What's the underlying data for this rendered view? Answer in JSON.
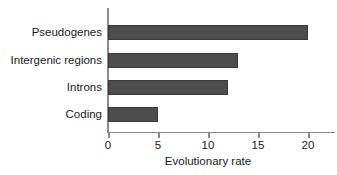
{
  "chart_data": {
    "type": "bar",
    "orientation": "horizontal",
    "title": "",
    "xlabel": "Evolutionary rate",
    "ylabel": "",
    "categories": [
      "Pseudogenes",
      "Intergenic regions",
      "Introns",
      "Coding"
    ],
    "values": [
      20,
      13,
      12,
      5
    ],
    "xticks": [
      0,
      5,
      10,
      15,
      20
    ],
    "xticklabels": [
      "0",
      "5",
      "10",
      "15",
      "20"
    ],
    "xlim": [
      0,
      22.5
    ],
    "grid": false,
    "legend": null,
    "bar_color": "#4d4d4d",
    "axis_color": "#8a8a8a",
    "background_color": "#ffffff",
    "bars": [
      {
        "category": "Pseudogenes",
        "value": 20
      },
      {
        "category": "Intergenic regions",
        "value": 13
      },
      {
        "category": "Introns",
        "value": 12
      },
      {
        "category": "Coding",
        "value": 5
      }
    ]
  }
}
